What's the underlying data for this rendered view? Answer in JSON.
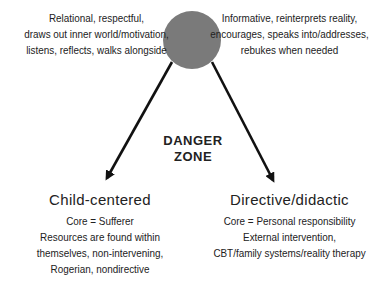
{
  "diagram": {
    "circle": {
      "color": "#7a7a7a",
      "cx": 192,
      "cy": 40,
      "r": 29
    },
    "arrow_color": "#111111",
    "top_left_text": [
      "Relational, respectful,",
      "draws out inner world/motivation,",
      "listens, reflects, walks alongside"
    ],
    "top_right_text": [
      "Informative, reinterprets reality,",
      "encourages, speaks into/addresses,",
      "rebukes when needed"
    ],
    "danger_zone": [
      "DANGER",
      "ZONE"
    ],
    "left_branch": {
      "heading": "Child-centered",
      "lines": [
        "Core = Sufferer",
        "Resources are found within",
        "themselves, non-intervening,",
        "Rogerian, nondirective"
      ]
    },
    "right_branch": {
      "heading": "Directive/didactic",
      "lines": [
        "Core = Personal responsibility",
        "External intervention,",
        "CBT/family systems/reality therapy"
      ]
    }
  }
}
